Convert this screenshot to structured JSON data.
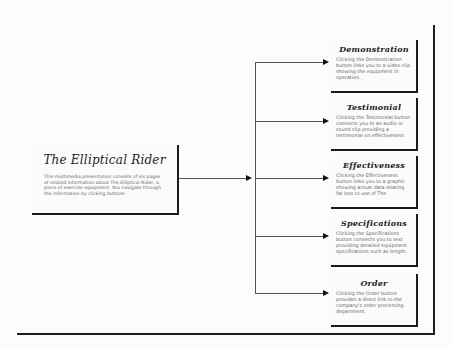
{
  "diagram": {
    "main": {
      "title": "The Elliptical Rider",
      "description": "This multimedia presentation consists of six pages of related information about The Elliptical Rider, a piece of exercise equipment. You navigate through the information by clicking buttons"
    },
    "pages": [
      {
        "title": "Demonstration",
        "description": "Clicking the Demonstration button links you to a video clip showing the equipment in operation."
      },
      {
        "title": "Testimonial",
        "description": "Clicking the Testimonial button connects you to an audio or sound clip providing a testimonial on effectiveness"
      },
      {
        "title": "Effectiveness",
        "description": "Clicking the Effectiveness button links you to a graphic showing actual data relating fat loss to use of The"
      },
      {
        "title": "Specifications",
        "description": "Clicking the Specifications button connects you to text providing detailed equipment specifications such as length,"
      },
      {
        "title": "Order",
        "description": "Clicking the Order button provides a direct link to the company's order processing department."
      }
    ],
    "colors": {
      "background": "#fcfcfc",
      "border": "#1a1a1a",
      "connector": "#555555",
      "text": "#666666",
      "title": "#222222"
    }
  }
}
